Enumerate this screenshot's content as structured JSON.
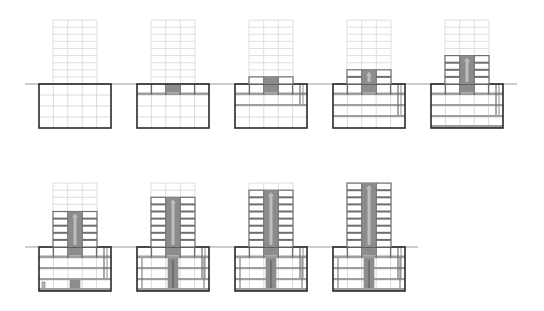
{
  "diagram": {
    "title": "",
    "colors": {
      "ghost": "#d8d8d8",
      "frame": "#6e6e6e",
      "outline": "#2a2a2a",
      "core": "#8c8c8c",
      "core_light": "#bdbdbd",
      "ground": "#9a9a9a",
      "slab": "#9e9e9e"
    },
    "geometry": {
      "tower_width": 44,
      "box_width": 72,
      "floor_h": 7.1,
      "ghost_floors": 9,
      "box_rows": 4,
      "box_row_h": 11
    },
    "rows": [
      {
        "ground_y": 84,
        "ground_x1": 25,
        "ground_x2": 517
      },
      {
        "ground_y": 247,
        "ground_x1": 25,
        "ground_x2": 418
      }
    ],
    "stages": [
      {
        "id": 1,
        "row": 0,
        "x": 39,
        "built_floors": 0,
        "slabs_done": 0,
        "core_below": false,
        "core_col": false,
        "bottom_slab": false
      },
      {
        "id": 2,
        "row": 0,
        "x": 137,
        "built_floors": 0,
        "slabs_done": 1,
        "core_below": true,
        "core_col": false,
        "bottom_slab": false
      },
      {
        "id": 3,
        "row": 0,
        "x": 235,
        "built_floors": 1,
        "slabs_done": 2,
        "core_below": true,
        "core_col": false,
        "bottom_slab": false
      },
      {
        "id": 4,
        "row": 0,
        "x": 333,
        "built_floors": 2,
        "slabs_done": 3,
        "core_below": true,
        "core_col": false,
        "bottom_slab": false
      },
      {
        "id": 5,
        "row": 0,
        "x": 431,
        "built_floors": 4,
        "slabs_done": 4,
        "core_below": true,
        "core_col": false,
        "bottom_slab": true
      },
      {
        "id": 6,
        "row": 1,
        "x": 39,
        "built_floors": 5,
        "slabs_done": 4,
        "core_below": true,
        "core_col": "low",
        "bottom_slab": true
      },
      {
        "id": 7,
        "row": 1,
        "x": 137,
        "built_floors": 7,
        "slabs_done": 4,
        "core_below": true,
        "core_col": "mid",
        "bottom_slab": true
      },
      {
        "id": 8,
        "row": 1,
        "x": 235,
        "built_floors": 8,
        "slabs_done": 4,
        "core_below": true,
        "core_col": "full",
        "bottom_slab": true
      },
      {
        "id": 9,
        "row": 1,
        "x": 333,
        "built_floors": 9,
        "slabs_done": 4,
        "core_below": true,
        "core_col": "full",
        "bottom_slab": true
      }
    ]
  }
}
